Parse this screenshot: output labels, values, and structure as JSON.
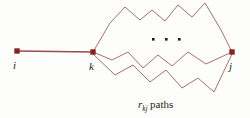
{
  "figure": {
    "type": "graph-diagram",
    "background_color": "#fdfdfc",
    "edge_color": "#9a6060",
    "direct_edge_color": "#9c4a4a",
    "node_color": "#8b2222",
    "text_color": "#1c1c1c",
    "nodes": [
      {
        "id": "i",
        "label": "i",
        "x": 17,
        "y": 51
      },
      {
        "id": "k",
        "label": "k",
        "x": 93,
        "y": 52
      },
      {
        "id": "j",
        "label": "j",
        "x": 232,
        "y": 52
      }
    ],
    "direct_edge": {
      "from": "i",
      "to": "k"
    },
    "paths": [
      {
        "name": "upper-path",
        "points": "93,52 110,23 125,7 140,20 152,10 165,21 178,5 192,17 205,3 221,30 232,52"
      },
      {
        "name": "middle-path",
        "points": "93,52 112,60 128,52 143,68 158,55 172,66 188,52 206,64 232,52"
      },
      {
        "name": "lower-path",
        "points": "93,54 115,75 133,65 150,82 166,70 182,88 198,78 214,92 232,54"
      }
    ],
    "ellipsis": {
      "label": "• • •",
      "dots": 3,
      "x": 152,
      "y": 38,
      "spacing": 13
    },
    "caption": {
      "symbol": "r",
      "subscript": "kj",
      "word": "paths",
      "full_text": "r_kj paths"
    }
  }
}
